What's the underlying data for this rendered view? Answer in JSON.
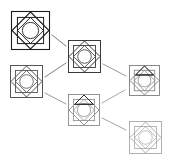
{
  "diagram": {
    "type": "node-link-tree",
    "canvas": {
      "width": 170,
      "height": 160,
      "background": "#ffffff"
    },
    "title": "",
    "nodes": [
      {
        "id": "node-1",
        "label": "",
        "x": 11,
        "y": 11,
        "size": 39,
        "stroke": "#1c1c1c",
        "stroke_width": 1.1,
        "glyph": "nested-square-diamond",
        "shade": "black",
        "has_top_triangle": false,
        "has_inner_circle": true
      },
      {
        "id": "node-2",
        "label": "",
        "x": 68,
        "y": 40,
        "size": 33,
        "stroke": "#3a3a3a",
        "stroke_width": 1.0,
        "glyph": "nested-square-diamond",
        "shade": "dark-gray",
        "has_top_triangle": false,
        "has_inner_circle": true
      },
      {
        "id": "node-3",
        "label": "",
        "x": 10,
        "y": 65,
        "size": 33,
        "stroke": "#555555",
        "stroke_width": 1.0,
        "glyph": "nested-square-diamond",
        "shade": "mid-gray",
        "has_top_triangle": false,
        "has_inner_circle": true
      },
      {
        "id": "node-4",
        "label": "",
        "x": 129,
        "y": 65,
        "size": 31,
        "stroke": "#7d7d7d",
        "stroke_width": 0.9,
        "glyph": "nested-square-diamond",
        "shade": "gray",
        "has_top_triangle": true,
        "has_inner_circle": true
      },
      {
        "id": "node-5",
        "label": "",
        "x": 68,
        "y": 94,
        "size": 32,
        "stroke": "#8a8a8a",
        "stroke_width": 0.9,
        "glyph": "nested-square-diamond",
        "shade": "gray",
        "has_top_triangle": true,
        "has_inner_circle": true
      },
      {
        "id": "node-6",
        "label": "",
        "x": 129,
        "y": 121,
        "size": 33,
        "stroke": "#a8a8a8",
        "stroke_width": 0.9,
        "glyph": "nested-square-diamond",
        "shade": "light-gray",
        "has_top_triangle": false,
        "has_inner_circle": true
      }
    ],
    "edges": [
      {
        "id": "edge-1-2",
        "from": "node-1",
        "to": "node-2",
        "x1": 52,
        "y1": 35,
        "x2": 66,
        "y2": 46,
        "stroke": "#6e6e6e"
      },
      {
        "id": "edge-3-2",
        "from": "node-3",
        "to": "node-2",
        "x1": 45,
        "y1": 77,
        "x2": 66,
        "y2": 63,
        "stroke": "#6e6e6e"
      },
      {
        "id": "edge-2-4",
        "from": "node-2",
        "to": "node-4",
        "x1": 103,
        "y1": 64,
        "x2": 126,
        "y2": 76,
        "stroke": "#8d8d8d"
      },
      {
        "id": "edge-3-5",
        "from": "node-3",
        "to": "node-5",
        "x1": 45,
        "y1": 93,
        "x2": 66,
        "y2": 104,
        "stroke": "#8d8d8d"
      },
      {
        "id": "edge-5-4",
        "from": "node-5",
        "to": "node-4",
        "x1": 102,
        "y1": 103,
        "x2": 125,
        "y2": 90,
        "stroke": "#9a9a9a"
      },
      {
        "id": "edge-5-6",
        "from": "node-5",
        "to": "node-6",
        "x1": 102,
        "y1": 118,
        "x2": 126,
        "y2": 130,
        "stroke": "#9a9a9a"
      }
    ]
  }
}
